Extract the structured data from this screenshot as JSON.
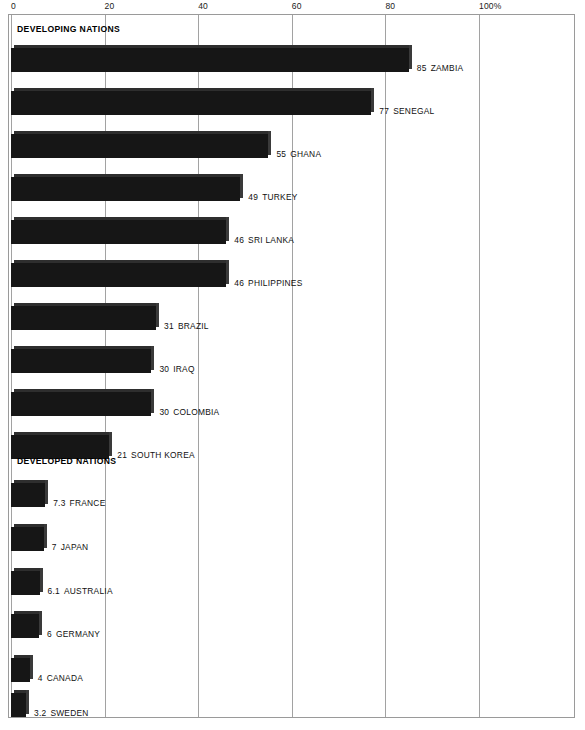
{
  "chart_data": {
    "type": "bar",
    "orientation": "horizontal",
    "title": "",
    "subtitle": "",
    "xlabel": "",
    "ylabel": "",
    "xlim": [
      0,
      110
    ],
    "grid": true,
    "legend_position": "none",
    "axis_position": "top",
    "tick_labels": [
      "0",
      "20",
      "40",
      "60",
      "80",
      "100%"
    ],
    "tick_values": [
      0,
      20,
      40,
      60,
      80,
      100
    ],
    "groups": [
      {
        "name": "DEVELOPING NATIONS",
        "categories": [
          "ZAMBIA",
          "SENEGAL",
          "GHANA",
          "TURKEY",
          "SRI LANKA",
          "PHILIPPINES",
          "BRAZIL",
          "IRAQ",
          "COLOMBIA",
          "SOUTH KOREA"
        ],
        "values": [
          85,
          77,
          55,
          49,
          46,
          46,
          31,
          30,
          30,
          21
        ],
        "value_labels": [
          "85",
          "77",
          "55",
          "49",
          "46",
          "46",
          "31",
          "30",
          "30",
          "21"
        ]
      },
      {
        "name": "DEVELOPED NATIONS",
        "categories": [
          "FRANCE",
          "JAPAN",
          "AUSTRALIA",
          "GERMANY",
          "CANADA",
          "SWEDEN"
        ],
        "values": [
          7.3,
          7,
          6.1,
          6,
          4,
          3.2
        ],
        "value_labels": [
          "7.3",
          "7",
          "6.1",
          "6",
          "4",
          "3.2"
        ]
      }
    ],
    "bar_color": "#161616",
    "gridline_color": "#a2a2a2",
    "background_color": "#ffffff"
  },
  "axis": {
    "ticks": [
      {
        "label": "0",
        "value": 0
      },
      {
        "label": "20",
        "value": 20
      },
      {
        "label": "40",
        "value": 40
      },
      {
        "label": "60",
        "value": 60
      },
      {
        "label": "80",
        "value": 80
      },
      {
        "label": "100%",
        "value": 100
      }
    ]
  },
  "sections": [
    {
      "label": "DEVELOPING NATIONS"
    },
    {
      "label": "DEVELOPED NATIONS"
    }
  ],
  "bars": [
    {
      "value_label": "85",
      "name": "ZAMBIA",
      "value": 85
    },
    {
      "value_label": "77",
      "name": "SENEGAL",
      "value": 77
    },
    {
      "value_label": "55",
      "name": "GHANA",
      "value": 55
    },
    {
      "value_label": "49",
      "name": "TURKEY",
      "value": 49
    },
    {
      "value_label": "46",
      "name": "SRI LANKA",
      "value": 46
    },
    {
      "value_label": "46",
      "name": "PHILIPPINES",
      "value": 46
    },
    {
      "value_label": "31",
      "name": "BRAZIL",
      "value": 31
    },
    {
      "value_label": "30",
      "name": "IRAQ",
      "value": 30
    },
    {
      "value_label": "30",
      "name": "COLOMBIA",
      "value": 30
    },
    {
      "value_label": "21",
      "name": "SOUTH KOREA",
      "value": 21
    },
    {
      "value_label": "7.3",
      "name": "FRANCE",
      "value": 7.3
    },
    {
      "value_label": "7",
      "name": "JAPAN",
      "value": 7
    },
    {
      "value_label": "6.1",
      "name": "AUSTRALIA",
      "value": 6.1
    },
    {
      "value_label": "6",
      "name": "GERMANY",
      "value": 6
    },
    {
      "value_label": "4",
      "name": "CANADA",
      "value": 4
    },
    {
      "value_label": "3.2",
      "name": "SWEDEN",
      "value": 3.2
    }
  ]
}
